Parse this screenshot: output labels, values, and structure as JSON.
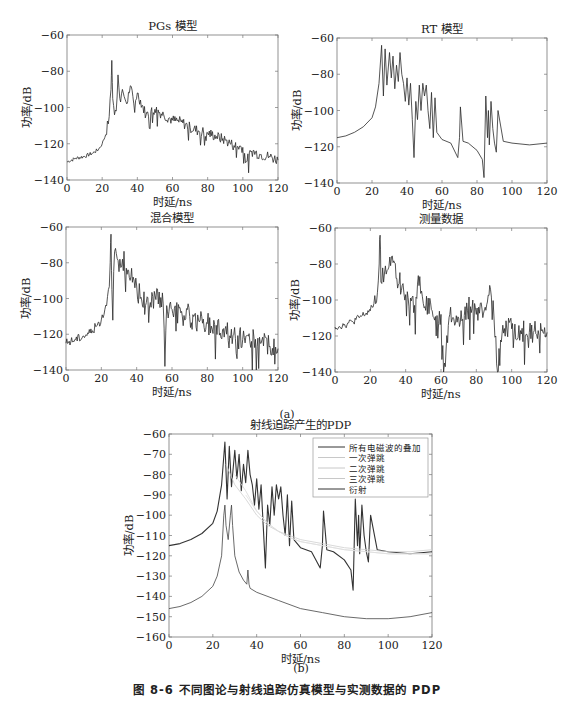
{
  "figure": {
    "caption": "图 8-6   不同图论与射线追踪仿真模型与实测数据的 PDP",
    "sublabel_a": "(a)",
    "sublabel_b": "(b)"
  },
  "chart_data": [
    {
      "id": "pgs",
      "type": "line",
      "title": "PGs 模型",
      "xlabel": "时延/ns",
      "ylabel": "功率/dB",
      "xlim": [
        0,
        120
      ],
      "ylim": [
        -140,
        -60
      ],
      "xticks": [
        0,
        20,
        40,
        60,
        80,
        100,
        120
      ],
      "yticks": [
        -60,
        -80,
        -100,
        -120,
        -140
      ],
      "series": [
        {
          "name": "PGs",
          "x": [
            0,
            5,
            10,
            15,
            18,
            20,
            22,
            24,
            25,
            25.5,
            26,
            27,
            28,
            29,
            30,
            32,
            34,
            36,
            38,
            40,
            45,
            50,
            55,
            60,
            65,
            70,
            75,
            80,
            85,
            90,
            95,
            100,
            102,
            105,
            110,
            115,
            120
          ],
          "values": [
            -130,
            -128,
            -127,
            -125,
            -123,
            -120,
            -115,
            -105,
            -90,
            -74,
            -95,
            -104,
            -102,
            -82,
            -95,
            -92,
            -98,
            -88,
            -98,
            -92,
            -104,
            -101,
            -104,
            -107,
            -108,
            -111,
            -113,
            -114,
            -116,
            -118,
            -121,
            -122,
            -130,
            -124,
            -126,
            -127,
            -129
          ]
        }
      ],
      "grid": false
    },
    {
      "id": "rt",
      "type": "line",
      "title": "RT 模型",
      "xlabel": "时延/ns",
      "ylabel": "功率/dB",
      "xlim": [
        0,
        120
      ],
      "ylim": [
        -140,
        -60
      ],
      "xticks": [
        0,
        20,
        40,
        60,
        80,
        100,
        120
      ],
      "yticks": [
        -60,
        -80,
        -100,
        -120,
        -140
      ],
      "series": [
        {
          "name": "RT",
          "x": [
            0,
            5,
            10,
            15,
            20,
            22,
            24,
            25.5,
            26.5,
            27.5,
            28.5,
            30,
            31,
            32,
            33,
            34,
            35,
            36,
            37,
            38,
            39,
            40,
            41,
            42,
            43,
            44,
            45,
            46,
            47,
            48,
            49,
            50,
            51,
            52,
            53,
            54,
            55,
            56,
            57,
            60,
            65,
            69,
            70,
            70.5,
            72,
            75,
            80,
            83,
            84,
            85,
            86,
            86.5,
            87,
            88,
            89,
            90,
            91,
            92,
            95,
            100,
            110,
            120
          ],
          "values": [
            -115,
            -114,
            -112,
            -109,
            -104,
            -98,
            -85,
            -64,
            -92,
            -66,
            -86,
            -68,
            -82,
            -70,
            -88,
            -75,
            -84,
            -68,
            -80,
            -85,
            -95,
            -82,
            -97,
            -85,
            -105,
            -126,
            -95,
            -105,
            -86,
            -100,
            -85,
            -92,
            -86,
            -100,
            -110,
            -90,
            -115,
            -93,
            -112,
            -116,
            -118,
            -126,
            -115,
            -98,
            -117,
            -118,
            -122,
            -127,
            -137,
            -92,
            -115,
            -100,
            -119,
            -95,
            -110,
            -118,
            -123,
            -100,
            -117,
            -118,
            -119,
            -118
          ]
        }
      ],
      "grid": false
    },
    {
      "id": "hybrid",
      "type": "line",
      "title": "混合模型",
      "xlabel": "时延/ns",
      "ylabel": "功率/dB",
      "xlim": [
        0,
        120
      ],
      "ylim": [
        -140,
        -60
      ],
      "xticks": [
        0,
        20,
        40,
        60,
        80,
        100,
        120
      ],
      "yticks": [
        -60,
        -80,
        -100,
        -120,
        -140
      ],
      "series": [
        {
          "name": "混合",
          "x": [
            0,
            5,
            10,
            15,
            20,
            22,
            24,
            25,
            25.5,
            26,
            27,
            28,
            30,
            32,
            35,
            38,
            40,
            42,
            45,
            50,
            55,
            56,
            57,
            60,
            65,
            70,
            75,
            80,
            85,
            90,
            95,
            100,
            105,
            110,
            115,
            120
          ],
          "values": [
            -125,
            -123,
            -121,
            -118,
            -112,
            -106,
            -95,
            -80,
            -64,
            -95,
            -85,
            -72,
            -85,
            -78,
            -84,
            -88,
            -93,
            -100,
            -104,
            -96,
            -103,
            -138,
            -104,
            -106,
            -108,
            -110,
            -112,
            -114,
            -115,
            -117,
            -120,
            -123,
            -124,
            -125,
            -127,
            -128
          ]
        }
      ],
      "grid": false
    },
    {
      "id": "measured",
      "type": "line",
      "title": "测量数据",
      "xlabel": "时延/ns",
      "ylabel": "功率/dB",
      "xlim": [
        0,
        120
      ],
      "ylim": [
        -140,
        -60
      ],
      "xticks": [
        0,
        20,
        40,
        60,
        80,
        100,
        120
      ],
      "yticks": [
        -60,
        -80,
        -100,
        -120,
        -140
      ],
      "series": [
        {
          "name": "测量",
          "x": [
            0,
            5,
            10,
            15,
            20,
            22,
            24,
            25,
            25.5,
            26,
            28,
            30,
            32,
            35,
            38,
            40,
            45,
            48,
            50,
            55,
            60,
            62,
            65,
            70,
            75,
            78,
            80,
            85,
            88,
            90,
            92,
            95,
            100,
            105,
            110,
            115,
            120
          ],
          "values": [
            -115,
            -114,
            -112,
            -109,
            -106,
            -102,
            -96,
            -80,
            -64,
            -90,
            -85,
            -83,
            -76,
            -88,
            -92,
            -97,
            -103,
            -87,
            -102,
            -106,
            -108,
            -135,
            -108,
            -110,
            -106,
            -100,
            -108,
            -104,
            -94,
            -110,
            -140,
            -114,
            -116,
            -117,
            -118,
            -117,
            -118
          ]
        }
      ],
      "grid": false
    },
    {
      "id": "rt_pdp",
      "type": "line",
      "title": "射线追踪产生的PDP",
      "xlabel": "时延/ns",
      "ylabel": "功率/dB",
      "xlim": [
        0,
        120
      ],
      "ylim": [
        -160,
        -60
      ],
      "xticks": [
        0,
        20,
        40,
        60,
        80,
        100,
        120
      ],
      "yticks": [
        -60,
        -70,
        -80,
        -90,
        -100,
        -110,
        -120,
        -130,
        -140,
        -150,
        -160
      ],
      "legend": [
        "所有电磁波的叠加",
        "一次弹跳",
        "二次弹跳",
        "三次弹跳",
        "衍射"
      ],
      "legend_position": "upper right",
      "series": [
        {
          "name": "所有电磁波的叠加",
          "x": [
            0,
            5,
            10,
            15,
            20,
            22,
            24,
            25.5,
            26.5,
            27.5,
            28.5,
            30,
            31,
            32,
            33,
            34,
            35,
            36,
            37,
            38,
            39,
            40,
            41,
            42,
            43,
            44,
            45,
            46,
            47,
            48,
            49,
            50,
            51,
            52,
            53,
            54,
            55,
            56,
            57,
            60,
            65,
            69,
            70,
            70.5,
            72,
            75,
            80,
            83,
            84,
            85,
            86,
            86.5,
            87,
            88,
            89,
            90,
            91,
            92,
            95,
            100,
            110,
            120
          ],
          "values": [
            -115,
            -114,
            -112,
            -109,
            -104,
            -98,
            -85,
            -64,
            -92,
            -66,
            -86,
            -68,
            -82,
            -70,
            -88,
            -75,
            -84,
            -68,
            -80,
            -85,
            -95,
            -82,
            -97,
            -85,
            -105,
            -126,
            -95,
            -105,
            -86,
            -100,
            -85,
            -92,
            -86,
            -100,
            -110,
            -90,
            -115,
            -93,
            -112,
            -116,
            -118,
            -126,
            -115,
            -98,
            -117,
            -118,
            -122,
            -127,
            -137,
            -92,
            -115,
            -100,
            -119,
            -95,
            -110,
            -118,
            -123,
            -100,
            -117,
            -118,
            -119,
            -118
          ]
        },
        {
          "name": "一次弹跳",
          "x": [
            26,
            28,
            30,
            35,
            40,
            45,
            50,
            55,
            60,
            70,
            80,
            90,
            100,
            110,
            120
          ],
          "values": [
            -75,
            -80,
            -85,
            -92,
            -100,
            -105,
            -108,
            -110,
            -112,
            -114,
            -116,
            -117,
            -118,
            -118,
            -117
          ]
        },
        {
          "name": "二次弹跳",
          "x": [
            30,
            35,
            40,
            45,
            50,
            55,
            60,
            70,
            80,
            90,
            100,
            110,
            120
          ],
          "values": [
            -80,
            -88,
            -98,
            -104,
            -108,
            -111,
            -113,
            -115,
            -117,
            -118,
            -119,
            -119,
            -119
          ]
        },
        {
          "name": "三次弹跳",
          "x": [
            35,
            40,
            45,
            50,
            55,
            60,
            70,
            80,
            90,
            100,
            110,
            120
          ],
          "values": [
            -90,
            -98,
            -104,
            -108,
            -111,
            -113,
            -115,
            -117,
            -118,
            -119,
            -119,
            -119
          ]
        },
        {
          "name": "衍射",
          "x": [
            0,
            5,
            10,
            15,
            20,
            22,
            24,
            25,
            25.5,
            26,
            27,
            28,
            28.5,
            29,
            30,
            32,
            34,
            35.5,
            36,
            36.5,
            37,
            40,
            50,
            60,
            70,
            80,
            90,
            100,
            110,
            120
          ],
          "values": [
            -146,
            -145,
            -143,
            -140,
            -135,
            -130,
            -120,
            -100,
            -95,
            -105,
            -112,
            -100,
            -95,
            -105,
            -120,
            -128,
            -132,
            -134,
            -127,
            -134,
            -136,
            -138,
            -142,
            -146,
            -148,
            -150,
            -151,
            -151,
            -150,
            -148
          ]
        }
      ],
      "grid": false
    }
  ]
}
